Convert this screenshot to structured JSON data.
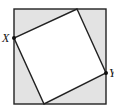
{
  "figure": {
    "outer_square": {
      "x": 14,
      "y": 9,
      "width": 92,
      "height": 95,
      "fill": "#e3e3e3",
      "stroke": "#222222"
    },
    "inner_square": {
      "points": "77,9 106,73 44,104 14,38",
      "fill": "#ffffff",
      "stroke": "#222222"
    },
    "points": [
      {
        "label": "X",
        "x": 14,
        "y": 38
      },
      {
        "label": "Y",
        "x": 106,
        "y": 73
      }
    ]
  }
}
